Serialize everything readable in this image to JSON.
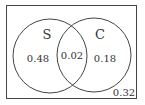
{
  "diagram": {
    "type": "venn",
    "sets": [
      {
        "name": "S",
        "only_value": "0.48"
      },
      {
        "name": "C",
        "only_value": "0.18"
      }
    ],
    "intersection_value": "0.02",
    "outside_value": "0.32",
    "stroke_color": "#444444"
  }
}
